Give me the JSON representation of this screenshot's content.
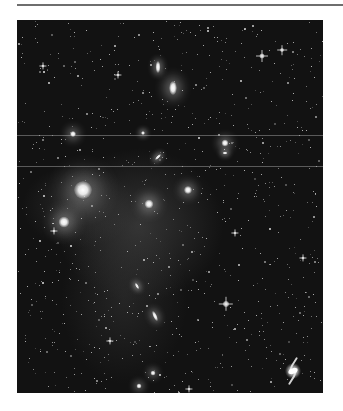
{
  "figure": {
    "background_color": "#121212",
    "rule_color": "#6e6e6e",
    "artifact_lines_y": [
      115,
      146
    ],
    "galaxies": [
      {
        "x": 141,
        "y": 47,
        "w": 5,
        "h": 12,
        "rot": 0,
        "core": "#ffffff",
        "glow": 6
      },
      {
        "x": 156,
        "y": 68,
        "w": 8,
        "h": 14,
        "rot": 0,
        "core": "#ffffff",
        "glow": 12
      },
      {
        "x": 66,
        "y": 170,
        "w": 18,
        "h": 18,
        "rot": 0,
        "core": "#ffffff",
        "glow": 22
      },
      {
        "x": 47,
        "y": 202,
        "w": 11,
        "h": 11,
        "rot": 0,
        "core": "#ffffff",
        "glow": 14
      },
      {
        "x": 132,
        "y": 184,
        "w": 9,
        "h": 9,
        "rot": 0,
        "core": "#ffffff",
        "glow": 12
      },
      {
        "x": 171,
        "y": 170,
        "w": 8,
        "h": 8,
        "rot": 0,
        "core": "#ffffff",
        "glow": 10
      },
      {
        "x": 208,
        "y": 123,
        "w": 7,
        "h": 7,
        "rot": 0,
        "core": "#ffffff",
        "glow": 9
      },
      {
        "x": 208,
        "y": 133,
        "w": 5,
        "h": 3,
        "rot": 0,
        "core": "#eeeeee",
        "glow": 5
      },
      {
        "x": 56,
        "y": 114,
        "w": 6,
        "h": 6,
        "rot": 0,
        "core": "#ffffff",
        "glow": 9
      },
      {
        "x": 126,
        "y": 113,
        "w": 4,
        "h": 4,
        "rot": 0,
        "core": "#f0f0f0",
        "glow": 5
      },
      {
        "x": 141,
        "y": 137,
        "w": 3,
        "h": 8,
        "rot": 45,
        "core": "#eeeeee",
        "glow": 5
      },
      {
        "x": 120,
        "y": 266,
        "w": 3,
        "h": 7,
        "rot": -30,
        "core": "#eeeeee",
        "glow": 5
      },
      {
        "x": 138,
        "y": 296,
        "w": 4,
        "h": 11,
        "rot": -25,
        "core": "#ffffff",
        "glow": 7
      },
      {
        "x": 136,
        "y": 353,
        "w": 5,
        "h": 5,
        "rot": 0,
        "core": "#ffffff",
        "glow": 7
      },
      {
        "x": 122,
        "y": 366,
        "w": 5,
        "h": 5,
        "rot": 0,
        "core": "#ffffff",
        "glow": 7
      }
    ],
    "stars": [
      {
        "x": 245,
        "y": 36,
        "size": 5
      },
      {
        "x": 265,
        "y": 30,
        "size": 4
      },
      {
        "x": 26,
        "y": 46,
        "size": 3
      },
      {
        "x": 101,
        "y": 55,
        "size": 3
      },
      {
        "x": 218,
        "y": 213,
        "size": 3
      },
      {
        "x": 209,
        "y": 284,
        "size": 6
      },
      {
        "x": 93,
        "y": 321,
        "size": 3
      },
      {
        "x": 37,
        "y": 211,
        "size": 3
      },
      {
        "x": 172,
        "y": 369,
        "size": 3
      },
      {
        "x": 286,
        "y": 238,
        "size": 3
      }
    ],
    "spiral": {
      "x": 276,
      "y": 351,
      "size": 26
    }
  }
}
